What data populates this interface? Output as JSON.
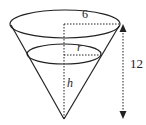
{
  "diagram": {
    "type": "inverted-cone",
    "labels": {
      "top_radius": "6",
      "water_radius": "r",
      "water_height": "h",
      "cone_height": "12"
    },
    "colors": {
      "stroke": "#222222",
      "background": "#ffffff"
    }
  }
}
